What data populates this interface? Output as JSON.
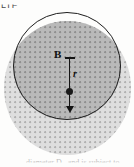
{
  "figure": {
    "kind": "scanned-physics-figure",
    "background_color": "#fdfdfc",
    "header_fragment": "LTF",
    "caption_fragment": "diameter D , and is subject to",
    "labels": {
      "field_label": "B",
      "radius_label": "r"
    },
    "disk": {
      "name": "dotted-region",
      "fill_color": "#dedede",
      "dot_color": "#b2b2b2",
      "dot_spacing_px": 5,
      "diameter_px": 127
    },
    "overlap": {
      "name": "intersection-region",
      "fill_color": "#b9b9b9",
      "dot_color": "#909090"
    },
    "loop": {
      "name": "circular-loop",
      "stroke_color": "#1d1d1d",
      "stroke_width_px": 1.15,
      "diameter_px": 108
    },
    "arrow": {
      "name": "radius-arrow",
      "color": "#141414",
      "direction": "downward"
    },
    "center_point": {
      "name": "center-marker",
      "color": "#1a1a1a"
    }
  }
}
